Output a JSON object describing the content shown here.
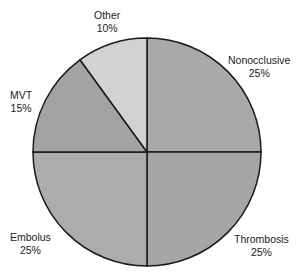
{
  "chart_data": {
    "type": "pie",
    "title": "",
    "categories": [
      "Nonocclusive",
      "Thrombosis",
      "Embolus",
      "MVT",
      "Other"
    ],
    "values": [
      25,
      25,
      25,
      15,
      10
    ],
    "labels": [
      {
        "name": "Nonocclusive",
        "pct": "25%"
      },
      {
        "name": "Thrombosis",
        "pct": "25%"
      },
      {
        "name": "Embolus",
        "pct": "25%"
      },
      {
        "name": "MVT",
        "pct": "15%"
      },
      {
        "name": "Other",
        "pct": "10%"
      }
    ],
    "colors": [
      "#a9a9a9",
      "#a6a6a6",
      "#acacac",
      "#a3a3a3",
      "#d2d2d2"
    ],
    "start_angle": "12 o'clock",
    "direction": "clockwise",
    "legend": "none"
  }
}
